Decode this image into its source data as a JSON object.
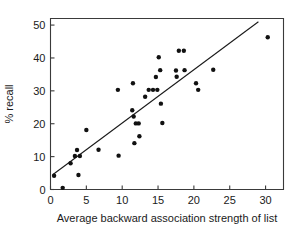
{
  "chart_data": {
    "type": "scatter",
    "title": "",
    "xlabel": "Average backward association strength of list",
    "ylabel": "% recall",
    "xlim": [
      0,
      32.5
    ],
    "ylim": [
      0,
      52
    ],
    "xticks": [
      0,
      5,
      10,
      15,
      20,
      25,
      30
    ],
    "xtick_labels": [
      "0",
      "5",
      "10",
      "15",
      "20",
      "25",
      "30"
    ],
    "yticks": [
      0,
      10,
      20,
      30,
      40,
      50
    ],
    "ytick_labels": [
      "0",
      "10",
      "20",
      "30",
      "40",
      "50"
    ],
    "grid": false,
    "legend": null,
    "marker": "filled-circle",
    "marker_color": "#111111",
    "points": [
      {
        "x": 0.5,
        "y": 4.2
      },
      {
        "x": 1.7,
        "y": 0.5
      },
      {
        "x": 2.8,
        "y": 8.0
      },
      {
        "x": 3.4,
        "y": 10.2
      },
      {
        "x": 3.7,
        "y": 12.0
      },
      {
        "x": 3.9,
        "y": 4.4
      },
      {
        "x": 4.1,
        "y": 10.2
      },
      {
        "x": 5.0,
        "y": 18.1
      },
      {
        "x": 6.7,
        "y": 12.1
      },
      {
        "x": 9.4,
        "y": 30.3
      },
      {
        "x": 9.5,
        "y": 10.3
      },
      {
        "x": 11.4,
        "y": 24.1
      },
      {
        "x": 11.5,
        "y": 32.3
      },
      {
        "x": 11.6,
        "y": 22.2
      },
      {
        "x": 11.7,
        "y": 14.1
      },
      {
        "x": 11.9,
        "y": 20.1
      },
      {
        "x": 12.3,
        "y": 20.1
      },
      {
        "x": 12.4,
        "y": 16.2
      },
      {
        "x": 13.2,
        "y": 28.2
      },
      {
        "x": 13.7,
        "y": 30.3
      },
      {
        "x": 14.3,
        "y": 30.3
      },
      {
        "x": 14.9,
        "y": 30.3
      },
      {
        "x": 14.7,
        "y": 34.2
      },
      {
        "x": 15.1,
        "y": 40.2
      },
      {
        "x": 15.3,
        "y": 36.3
      },
      {
        "x": 15.4,
        "y": 26.1
      },
      {
        "x": 15.6,
        "y": 20.2
      },
      {
        "x": 17.5,
        "y": 36.2
      },
      {
        "x": 17.6,
        "y": 34.3
      },
      {
        "x": 17.9,
        "y": 42.2
      },
      {
        "x": 18.6,
        "y": 42.2
      },
      {
        "x": 18.7,
        "y": 36.3
      },
      {
        "x": 20.3,
        "y": 32.3
      },
      {
        "x": 20.6,
        "y": 30.3
      },
      {
        "x": 22.7,
        "y": 36.4
      },
      {
        "x": 30.3,
        "y": 46.3
      }
    ],
    "fit_line": {
      "label": "regression line",
      "x_start": 0.3,
      "y_start": 4.5,
      "x_end": 29.0,
      "y_end": 51.0
    }
  }
}
